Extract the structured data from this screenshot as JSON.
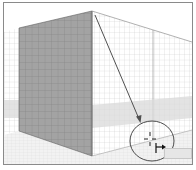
{
  "canvas": {
    "tool": "perspective-grid",
    "colors": {
      "frame": "#8a8a8a",
      "left_plane_fill": "#9c9c9c",
      "left_plane_grid": "#6e6e6e",
      "right_plane_grid": "#cfcfcf",
      "horizon_band": "#d8d8d8",
      "ground_grid": "#dcdcdc",
      "arrow": "#555555",
      "callout_circle": "#555555"
    }
  },
  "annotation": {
    "arrow": {
      "from": [
        95,
        15
      ],
      "to": [
        140,
        122
      ]
    },
    "callout": {
      "center": [
        152,
        141
      ],
      "rx": 22,
      "ry": 20
    }
  },
  "cursor": {
    "icon": "perspective-selection-crosshair-icon",
    "widget": "right-plane-indicator"
  },
  "tooltip": {
    "text": ""
  }
}
